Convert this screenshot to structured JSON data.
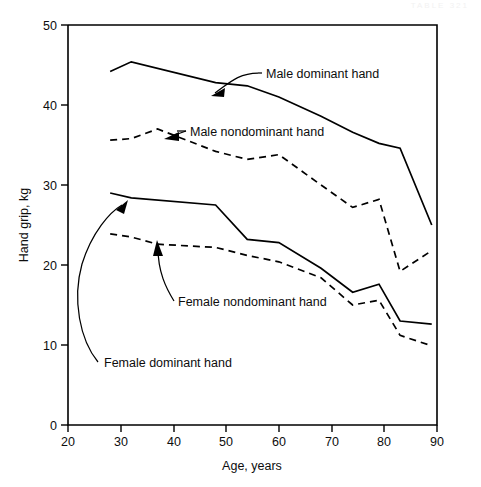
{
  "page": {
    "faint_header": "TABLE  321"
  },
  "chart_data": {
    "type": "line",
    "title": "",
    "xlabel": "Age, years",
    "ylabel": "Hand grip, kg",
    "xlim": [
      20,
      90
    ],
    "ylim": [
      0,
      50
    ],
    "xticks": [
      20,
      30,
      40,
      50,
      60,
      70,
      80,
      90
    ],
    "yticks": [
      0,
      10,
      20,
      30,
      40,
      50
    ],
    "grid": false,
    "legend_position": "inline-annotations",
    "frame": "box",
    "series": [
      {
        "name": "Male dominant hand",
        "style": "solid",
        "label": "Male dominant hand",
        "x": [
          28,
          32,
          48,
          54,
          60,
          68,
          74,
          79,
          83,
          89
        ],
        "y": [
          44.2,
          45.4,
          42.8,
          42.4,
          41.0,
          38.6,
          36.6,
          35.2,
          34.6,
          25.0
        ]
      },
      {
        "name": "Male nondominant hand",
        "style": "dashed",
        "label": "Male nondominant hand",
        "x": [
          28,
          32,
          37,
          48,
          54,
          60,
          68,
          74,
          79,
          83,
          89
        ],
        "y": [
          35.6,
          35.8,
          37.0,
          34.2,
          33.2,
          33.8,
          30.0,
          27.2,
          28.2,
          19.2,
          21.8
        ]
      },
      {
        "name": "Female dominant hand",
        "style": "solid",
        "label": "Female dominant hand",
        "x": [
          28,
          32,
          48,
          54,
          60,
          68,
          74,
          79,
          83,
          89
        ],
        "y": [
          29.0,
          28.4,
          27.5,
          23.2,
          22.8,
          19.6,
          16.6,
          17.6,
          13.0,
          12.6
        ]
      },
      {
        "name": "Female nondominant hand",
        "style": "dashed",
        "label": "Female nondominant hand",
        "x": [
          28,
          32,
          37,
          48,
          54,
          60,
          68,
          74,
          79,
          83,
          89
        ],
        "y": [
          23.9,
          23.5,
          22.6,
          22.2,
          21.2,
          20.4,
          18.4,
          15.0,
          15.6,
          11.2,
          9.9
        ]
      }
    ],
    "annotations": [
      {
        "name": "male-dominant-annotation",
        "text": "Male dominant hand",
        "points_to": {
          "x": 52,
          "y": 42.6
        }
      },
      {
        "name": "male-nondominant-annotation",
        "text": "Male nondominant hand",
        "points_to": {
          "x": 37,
          "y": 37.0
        }
      },
      {
        "name": "female-nondominant-annotation",
        "text": "Female nondominant hand",
        "points_to": {
          "x": 37,
          "y": 22.8
        }
      },
      {
        "name": "female-dominant-annotation",
        "text": "Female dominant hand",
        "points_to": {
          "x": 32,
          "y": 28.4
        }
      }
    ]
  }
}
